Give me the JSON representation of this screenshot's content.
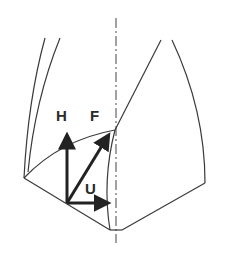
{
  "diagram": {
    "colors": {
      "line": "#3a3a3a",
      "arrow": "#222222",
      "background": "#ffffff"
    },
    "labels": {
      "H": "H",
      "F": "F",
      "U": "U"
    },
    "vectors": [
      {
        "name": "H",
        "from": [
          67,
          203
        ],
        "to": [
          67,
          133
        ]
      },
      {
        "name": "F",
        "from": [
          67,
          203
        ],
        "to": [
          110,
          133
        ]
      },
      {
        "name": "U",
        "from": [
          67,
          203
        ],
        "to": [
          110,
          203
        ]
      }
    ]
  }
}
